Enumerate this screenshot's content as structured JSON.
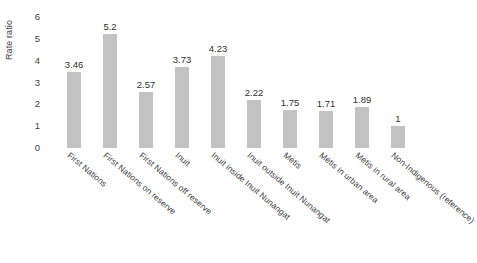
{
  "chart_data": {
    "type": "bar",
    "title": "",
    "xlabel": "",
    "ylabel": "Rate ratio",
    "ylim": [
      0,
      6
    ],
    "yticks": [
      "6",
      "5",
      "4",
      "3",
      "2",
      "1",
      "0"
    ],
    "grid": false,
    "legend": "none",
    "bar_color": "#c3c3c3",
    "categories": [
      "First Nations",
      "First Nations on reserve",
      "First Nations off reserve",
      "Inuit",
      "Inuit inside Inuit Nunangat",
      "Inuit outside Inuit Nunangat",
      "Métis",
      "Métis in urban area",
      "Métis in rural area",
      "Non-Indigenous (reference)"
    ],
    "values": [
      3.46,
      5.2,
      2.57,
      3.73,
      4.23,
      2.22,
      1.75,
      1.71,
      1.89,
      1
    ],
    "value_labels": [
      "3.46",
      "5.2",
      "2.57",
      "3.73",
      "4.23",
      "2.22",
      "1.75",
      "1.71",
      "1.89",
      "1"
    ]
  }
}
